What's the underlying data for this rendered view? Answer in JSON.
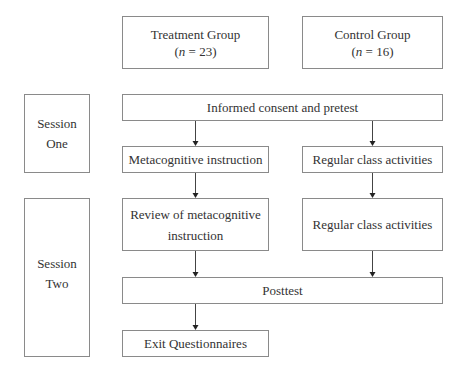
{
  "groups": {
    "treatment": {
      "label": "Treatment Group",
      "n_prefix": "(",
      "n_var": "n",
      "n_suffix": " = 23)"
    },
    "control": {
      "label": "Control Group",
      "n_prefix": "(",
      "n_var": "n",
      "n_suffix": " = 16)"
    }
  },
  "sessions": {
    "one": {
      "line1": "Session",
      "line2": "One"
    },
    "two": {
      "line1": "Session",
      "line2": "Two"
    }
  },
  "steps": {
    "consent": "Informed consent and pretest",
    "metacognitive": "Metacognitive instruction",
    "regular1": "Regular class activities",
    "review_line1": "Review of metacognitive",
    "review_line2": "instruction",
    "regular2": "Regular class activities",
    "posttest": "Posttest",
    "exit": "Exit Questionnaires"
  },
  "colors": {
    "border": "#8a8a8a",
    "arrow": "#222222",
    "text": "#333333"
  }
}
